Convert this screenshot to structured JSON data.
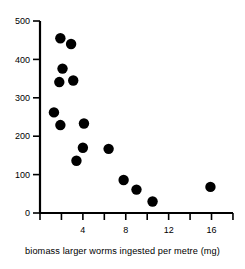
{
  "chart_data": {
    "type": "scatter",
    "title": "",
    "xlabel": "biomass larger worms ingested per metre (mg)",
    "ylabel": "",
    "xlim": [
      0,
      18
    ],
    "ylim": [
      0,
      500
    ],
    "grid": false,
    "legend": null,
    "x_ticks": [
      0,
      2,
      4,
      6,
      8,
      10,
      12,
      14,
      16,
      18
    ],
    "x_tick_labels": [
      "",
      "",
      "4",
      "",
      "8",
      "",
      "12",
      "",
      "16",
      ""
    ],
    "y_ticks": [
      0,
      100,
      200,
      300,
      400,
      500
    ],
    "y_tick_labels": [
      "0",
      "100",
      "200",
      "300",
      "400",
      "500"
    ],
    "marker": "filled-circle",
    "marker_color": "#000000",
    "marker_size": 5.2,
    "points": [
      {
        "x": 1.9,
        "y": 455
      },
      {
        "x": 2.9,
        "y": 440
      },
      {
        "x": 2.1,
        "y": 376
      },
      {
        "x": 1.8,
        "y": 341
      },
      {
        "x": 3.1,
        "y": 345
      },
      {
        "x": 1.3,
        "y": 262
      },
      {
        "x": 1.9,
        "y": 229
      },
      {
        "x": 4.1,
        "y": 233
      },
      {
        "x": 4.0,
        "y": 170
      },
      {
        "x": 3.4,
        "y": 136
      },
      {
        "x": 6.4,
        "y": 167
      },
      {
        "x": 7.8,
        "y": 86
      },
      {
        "x": 9.0,
        "y": 61
      },
      {
        "x": 10.5,
        "y": 30
      },
      {
        "x": 15.9,
        "y": 68
      }
    ]
  },
  "axis": {
    "x_title": "biomass larger worms ingested per metre (mg)"
  }
}
